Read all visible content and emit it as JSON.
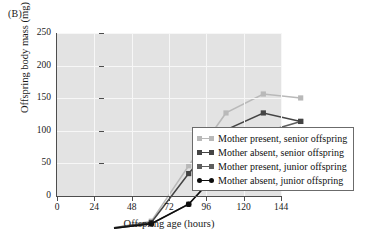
{
  "panel_label": "(B)",
  "chart_data": {
    "type": "line",
    "title": "",
    "xlabel": "Offspring age (hours)",
    "ylabel": "Offspring body mass (mg)",
    "x": [
      0,
      24,
      48,
      72,
      96,
      120
    ],
    "xlim": [
      0,
      144
    ],
    "ylim": [
      0,
      250
    ],
    "xticks": [
      0,
      24,
      48,
      72,
      96,
      120,
      144
    ],
    "yticks": [
      0,
      50,
      100,
      150,
      200,
      250
    ],
    "grid": true,
    "legend_position": "inside-lower-right",
    "series": [
      {
        "name": "Mother present, senior offspring",
        "color": "#b9b9b9",
        "marker": "square",
        "values": [
          2,
          12,
          97,
          178,
          207,
          201
        ]
      },
      {
        "name": "Mother absent, senior offspring",
        "color": "#444444",
        "marker": "square",
        "values": [
          2,
          10,
          85,
          152,
          178,
          165
        ]
      },
      {
        "name": "Mother present, junior offspring",
        "color": "#5e5e5e",
        "marker": "square",
        "values": [
          1,
          8,
          38,
          100,
          148,
          165
        ]
      },
      {
        "name": "Mother absent, junior offspring",
        "color": "#0d0d0d",
        "marker": "circle",
        "values": [
          1,
          8,
          38,
          100,
          148,
          137
        ]
      }
    ]
  },
  "legend": {
    "items": [
      "Mother present, senior offspring",
      "Mother absent, senior offspring",
      "Mother present, junior offspring",
      "Mother absent, junior offspring"
    ]
  }
}
